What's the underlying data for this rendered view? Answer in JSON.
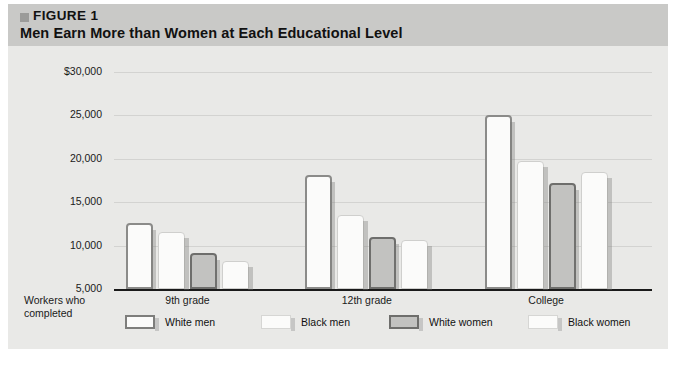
{
  "header": {
    "figure_label": "FIGURE 1",
    "title": "Men Earn More than Women at Each Educational Level",
    "bullet_color": "#9b9b99",
    "band_color": "#c9c9c7"
  },
  "chart_data": {
    "type": "bar",
    "title": "Men Earn More than Women at Each Educational Level",
    "xlabel": "Workers who completed",
    "ylabel": "",
    "ylim": [
      5000,
      30000
    ],
    "ytick_labels": [
      "$30,000",
      "25,000",
      "20,000",
      "15,000",
      "10,000",
      "5,000"
    ],
    "ytick_values": [
      30000,
      25000,
      20000,
      15000,
      10000,
      5000
    ],
    "grid": true,
    "legend_position": "bottom",
    "categories": [
      "9th grade",
      "12th grade",
      "College"
    ],
    "axis_caption_line1": "Workers who",
    "axis_caption_line2": "completed",
    "series": [
      {
        "name": "White men",
        "values": [
          12600,
          18100,
          25100
        ]
      },
      {
        "name": "Black men",
        "values": [
          11600,
          13500,
          19800
        ]
      },
      {
        "name": "White women",
        "values": [
          9100,
          11000,
          17200
        ]
      },
      {
        "name": "Black women",
        "values": [
          8200,
          10600,
          18500
        ]
      }
    ]
  },
  "legend": {
    "items": [
      {
        "label": "White men",
        "style": "wm"
      },
      {
        "label": "Black men",
        "style": "bm"
      },
      {
        "label": "White women",
        "style": "ww"
      },
      {
        "label": "Black women",
        "style": "bw"
      }
    ]
  },
  "footnote": {
    "text": ""
  }
}
